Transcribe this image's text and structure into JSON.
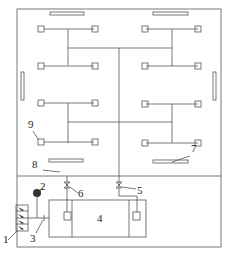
{
  "diagram": {
    "type": "schematic",
    "labels": [
      {
        "id": "1",
        "text": "1",
        "x": 3,
        "y": 243
      },
      {
        "id": "2",
        "text": "2",
        "x": 40,
        "y": 190
      },
      {
        "id": "3",
        "text": "3",
        "x": 30,
        "y": 242
      },
      {
        "id": "4",
        "text": "4",
        "x": 97,
        "y": 222
      },
      {
        "id": "5",
        "text": "5",
        "x": 137,
        "y": 194
      },
      {
        "id": "6",
        "text": "6",
        "x": 78,
        "y": 197
      },
      {
        "id": "7",
        "text": "7",
        "x": 191,
        "y": 152
      },
      {
        "id": "8",
        "text": "8",
        "x": 32,
        "y": 168
      },
      {
        "id": "9",
        "text": "9",
        "x": 28,
        "y": 128
      }
    ],
    "colors": {
      "line": "#555555",
      "background": "#ffffff"
    }
  }
}
